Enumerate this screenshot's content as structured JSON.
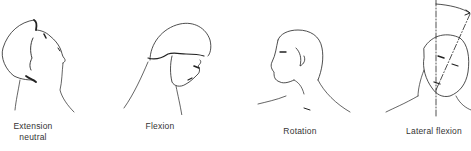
{
  "figure": {
    "panels": [
      {
        "id": "extension",
        "label": "Extension\nneutral"
      },
      {
        "id": "flexion",
        "label": "Flexion"
      },
      {
        "id": "rotation",
        "label": "Rotation"
      },
      {
        "id": "lateral_flexion",
        "label": "Lateral flexion"
      }
    ]
  }
}
